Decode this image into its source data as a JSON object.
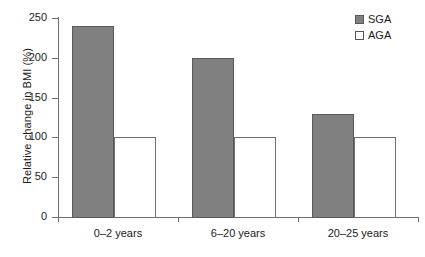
{
  "chart_data": {
    "type": "bar",
    "title": "",
    "xlabel": "",
    "ylabel": "Relative change in BMI (%)",
    "categories": [
      "0–2 years",
      "6–20 years",
      "20–25 years"
    ],
    "series": [
      {
        "name": "SGA",
        "values": [
          240,
          200,
          130
        ],
        "color": "#808080"
      },
      {
        "name": "AGA",
        "values": [
          100,
          100,
          100
        ],
        "color": "#ffffff"
      }
    ],
    "ylim": [
      0,
      250
    ],
    "ytick_labels": [
      "0",
      "50",
      "100",
      "150",
      "200",
      "250"
    ],
    "ytick_values": [
      0,
      50,
      100,
      150,
      200,
      250
    ],
    "grid": false,
    "legend_position": "top-right",
    "legend_entries": [
      {
        "label": "SGA",
        "swatch": "filled-gray-square"
      },
      {
        "label": "AGA",
        "swatch": "open-white-square"
      }
    ]
  },
  "axes": {
    "y_title": "Relative change in BMI (%)",
    "ticks": [
      {
        "label": "250",
        "value": 250
      },
      {
        "label": "200",
        "value": 200
      },
      {
        "label": "150",
        "value": 150
      },
      {
        "label": "100",
        "value": 100
      },
      {
        "label": "50",
        "value": 50
      },
      {
        "label": "0",
        "value": 0
      }
    ]
  },
  "groups": [
    {
      "label": "0–2 years",
      "bars": [
        {
          "series": "SGA",
          "value": 240
        },
        {
          "series": "AGA",
          "value": 100
        }
      ]
    },
    {
      "label": "6–20 years",
      "bars": [
        {
          "series": "SGA",
          "value": 200
        },
        {
          "series": "AGA",
          "value": 100
        }
      ]
    },
    {
      "label": "20–25 years",
      "bars": [
        {
          "series": "SGA",
          "value": 130
        },
        {
          "series": "AGA",
          "value": 100
        }
      ]
    }
  ],
  "legend": {
    "items": [
      {
        "label": "SGA",
        "kind": "sga"
      },
      {
        "label": "AGA",
        "kind": "aga"
      }
    ]
  },
  "colors": {
    "sga_fill": "#808080",
    "sga_border": "#5a5a5a",
    "aga_fill": "#ffffff",
    "aga_border": "#6e6e6e",
    "axis": "#6e6e6e",
    "text": "#1a1a1a",
    "background": "#ffffff"
  }
}
